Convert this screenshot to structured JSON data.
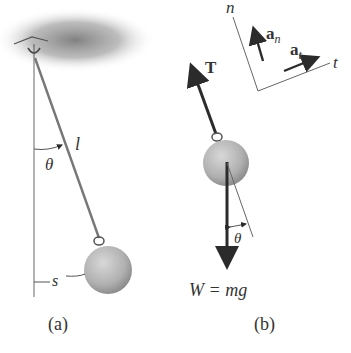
{
  "figure": {
    "panel_a": {
      "caption": "(a)",
      "labels": {
        "length": "l",
        "angle": "θ",
        "arc_length": "s"
      }
    },
    "panel_b": {
      "caption": "(b)",
      "labels": {
        "tension": "T",
        "angle": "θ",
        "weight": "W = mg",
        "normal_axis": "n",
        "tangential_axis": "t",
        "normal_accel": "a",
        "normal_accel_sub": "n",
        "tangential_accel": "a",
        "tangential_accel_sub": "t"
      }
    },
    "colors": {
      "ceiling": "#8a8a8a",
      "ball": "#b8b8b8",
      "arrow": "#2b2b2b",
      "line": "#555555",
      "text": "#333333"
    }
  }
}
